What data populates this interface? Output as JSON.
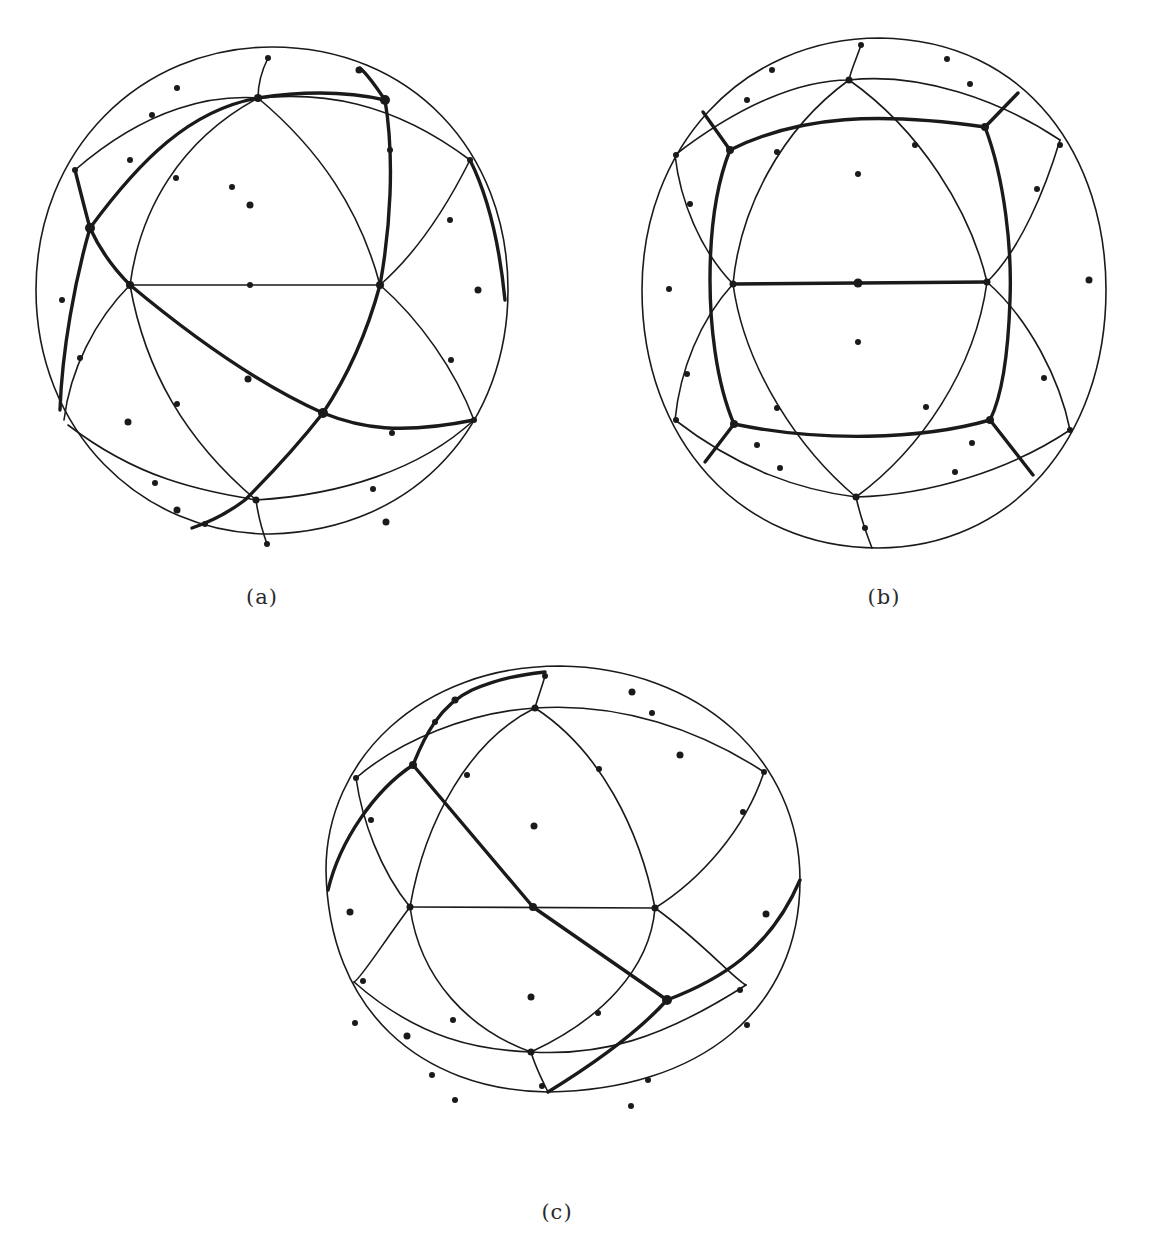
{
  "figure": {
    "panels": [
      {
        "id": "a",
        "label": "(a)",
        "description": "Sphere with geodesic triangulation and a thick great-circle path (triangular cycle)"
      },
      {
        "id": "b",
        "label": "(b)",
        "description": "Sphere with geodesic triangulation and a thick square-like closed path with radial spokes"
      },
      {
        "id": "c",
        "label": "(c)",
        "description": "Sphere with geodesic triangulation and a thick diagonal path crossing the center"
      }
    ]
  },
  "colors": {
    "ink": "#1a1a1a",
    "background": "#ffffff"
  }
}
